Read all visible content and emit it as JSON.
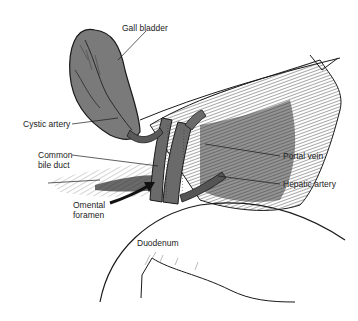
{
  "figure": {
    "labels": {
      "gall_bladder": "Gall bladder",
      "cystic_artery": "Cystic artery",
      "common_bile_duct_1": "Common",
      "common_bile_duct_2": "bile duct",
      "omental_foramen_1": "Omental",
      "omental_foramen_2": "foramen",
      "portal_vein": "Portal vein",
      "hepatic_artery": "Hepatic artery",
      "duodenum": "Duodenum"
    },
    "colors": {
      "ink": "#1a1a1a",
      "organ_fill": "#7a7a7a",
      "vessel_fill": "#6a6a6a",
      "shadow_fill": "#3a3a3a",
      "background": "#ffffff"
    }
  }
}
